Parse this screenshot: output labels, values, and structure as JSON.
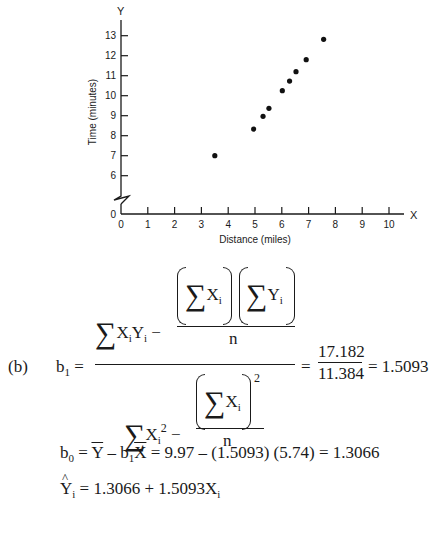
{
  "chart_data": {
    "type": "scatter",
    "title": "",
    "xlabel": "Distance (miles)",
    "ylabel": "Time (minutes)",
    "x_axis_letter": "X",
    "y_axis_letter": "Y",
    "xlim": [
      0,
      10
    ],
    "ylim_display": [
      6,
      13
    ],
    "y_axis_break": true,
    "grid": false,
    "x_ticks": [
      "0",
      "1",
      "2",
      "3",
      "4",
      "5",
      "6",
      "7",
      "8",
      "9",
      "10"
    ],
    "y_ticks": [
      "0",
      "6",
      "7",
      "8",
      "9",
      "10",
      "11",
      "12",
      "13"
    ],
    "points": [
      {
        "x": 3.5,
        "y": 7.0
      },
      {
        "x": 4.95,
        "y": 8.33
      },
      {
        "x": 5.3,
        "y": 8.97
      },
      {
        "x": 5.52,
        "y": 9.37
      },
      {
        "x": 6.02,
        "y": 10.25
      },
      {
        "x": 6.29,
        "y": 10.73
      },
      {
        "x": 6.53,
        "y": 11.2
      },
      {
        "x": 6.91,
        "y": 11.8
      },
      {
        "x": 7.56,
        "y": 12.82
      }
    ]
  },
  "formulas": {
    "part_label": "(b)",
    "b1": {
      "lhs": "b",
      "lhs_sub": "1",
      "eq": "=",
      "sigma": "∑",
      "num_term1_a": "X",
      "num_term1_sub_a": "i",
      "num_term1_b": "Y",
      "num_term1_sub_b": "i",
      "minus": "−",
      "num_frac_X": "X",
      "num_frac_Y": "Y",
      "sub_i": "i",
      "n": "n",
      "den_term1": "X",
      "den_term1_sup": "2",
      "den_frac_sup": "2",
      "result_eq": "=",
      "numerator_value": "17.182",
      "denominator_value": "11.384",
      "result_eq2": "=",
      "result": "1.5093"
    },
    "b0": {
      "lhs": "b",
      "lhs_sub": "0",
      "eq": "=",
      "ybar": "Y",
      "minus": "–",
      "b1": "b",
      "b1_sub": "1",
      "xbar": "X",
      "rest": "= 9.97 – (1.5093) (5.74) = 1.3066"
    },
    "yhat": {
      "lhs": "Y",
      "lhs_sub": "i",
      "rhs": "= 1.3066 + 1.5093X",
      "rhs_sub": "i"
    }
  }
}
